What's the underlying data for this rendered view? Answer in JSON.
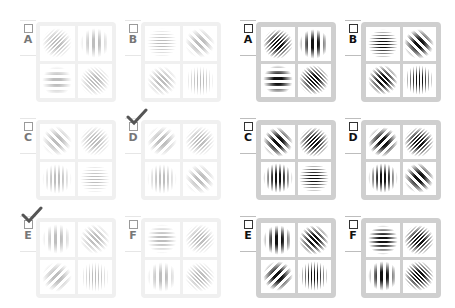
{
  "panels": [
    {
      "id": "left",
      "style": "faded",
      "items": [
        {
          "label": "A",
          "checked": false,
          "patches": [
            {
              "orientation": 45,
              "freq": "high"
            },
            {
              "orientation": 0,
              "freq": "low"
            },
            {
              "orientation": 90,
              "freq": "low"
            },
            {
              "orientation": -45,
              "freq": "high"
            }
          ]
        },
        {
          "label": "B",
          "checked": false,
          "patches": [
            {
              "orientation": 90,
              "freq": "high"
            },
            {
              "orientation": -45,
              "freq": "low"
            },
            {
              "orientation": -45,
              "freq": "mid"
            },
            {
              "orientation": 0,
              "freq": "high"
            }
          ]
        },
        {
          "label": "C",
          "checked": false,
          "patches": [
            {
              "orientation": -45,
              "freq": "low"
            },
            {
              "orientation": 45,
              "freq": "high"
            },
            {
              "orientation": 0,
              "freq": "mid"
            },
            {
              "orientation": 90,
              "freq": "high"
            }
          ]
        },
        {
          "label": "D",
          "checked": true,
          "patches": [
            {
              "orientation": 45,
              "freq": "low"
            },
            {
              "orientation": 45,
              "freq": "high"
            },
            {
              "orientation": 0,
              "freq": "mid"
            },
            {
              "orientation": -45,
              "freq": "low"
            }
          ]
        },
        {
          "label": "E",
          "checked": true,
          "patches": [
            {
              "orientation": 0,
              "freq": "low"
            },
            {
              "orientation": -45,
              "freq": "mid"
            },
            {
              "orientation": 45,
              "freq": "low"
            },
            {
              "orientation": 0,
              "freq": "high"
            }
          ]
        },
        {
          "label": "F",
          "checked": false,
          "patches": [
            {
              "orientation": 90,
              "freq": "mid"
            },
            {
              "orientation": 45,
              "freq": "high"
            },
            {
              "orientation": 0,
              "freq": "low"
            },
            {
              "orientation": -45,
              "freq": "high"
            }
          ]
        }
      ]
    },
    {
      "id": "right",
      "style": "high-contrast",
      "items": [
        {
          "label": "A",
          "checked": false,
          "patches": [
            {
              "orientation": 45,
              "freq": "high"
            },
            {
              "orientation": 0,
              "freq": "low"
            },
            {
              "orientation": 90,
              "freq": "low"
            },
            {
              "orientation": -45,
              "freq": "high"
            }
          ]
        },
        {
          "label": "B",
          "checked": false,
          "patches": [
            {
              "orientation": 90,
              "freq": "high"
            },
            {
              "orientation": -45,
              "freq": "low"
            },
            {
              "orientation": -45,
              "freq": "mid"
            },
            {
              "orientation": 0,
              "freq": "high"
            }
          ]
        },
        {
          "label": "C",
          "checked": false,
          "patches": [
            {
              "orientation": -45,
              "freq": "low"
            },
            {
              "orientation": 45,
              "freq": "high"
            },
            {
              "orientation": 0,
              "freq": "mid"
            },
            {
              "orientation": 90,
              "freq": "high"
            }
          ]
        },
        {
          "label": "D",
          "checked": false,
          "patches": [
            {
              "orientation": 45,
              "freq": "low"
            },
            {
              "orientation": 45,
              "freq": "high"
            },
            {
              "orientation": 0,
              "freq": "mid"
            },
            {
              "orientation": -45,
              "freq": "low"
            }
          ]
        },
        {
          "label": "E",
          "checked": false,
          "patches": [
            {
              "orientation": 0,
              "freq": "low"
            },
            {
              "orientation": -45,
              "freq": "mid"
            },
            {
              "orientation": 45,
              "freq": "low"
            },
            {
              "orientation": 0,
              "freq": "high"
            }
          ]
        },
        {
          "label": "F",
          "checked": false,
          "patches": [
            {
              "orientation": 90,
              "freq": "mid"
            },
            {
              "orientation": 45,
              "freq": "high"
            },
            {
              "orientation": 0,
              "freq": "low"
            },
            {
              "orientation": -45,
              "freq": "high"
            }
          ]
        }
      ]
    }
  ],
  "colors": {
    "left_stripe": "#8a8a8a",
    "right_stripe": "#111111",
    "left_frame": "#f0f0f0",
    "right_frame": "#cfcfcf",
    "checkmark": "#555555"
  }
}
